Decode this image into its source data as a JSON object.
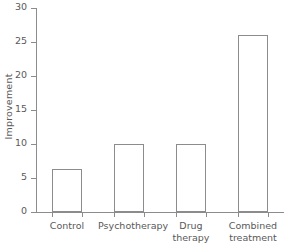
{
  "chart_data": {
    "type": "bar",
    "title": "",
    "subtitle": "",
    "xlabel": "",
    "ylabel": "Improvement",
    "categories": [
      "Control",
      "Psychotherapy",
      "Drug\ntherapy",
      "Combined\ntreatment"
    ],
    "values": [
      6.3,
      10,
      10,
      26
    ],
    "ylim": [
      0,
      30
    ],
    "yticks": [
      0,
      5,
      10,
      15,
      20,
      25,
      30
    ],
    "ytick_labels": [
      "0",
      "5",
      "10",
      "15",
      "20",
      "25",
      "30"
    ],
    "grid": false,
    "legend": null,
    "bar_fill": "#ffffff",
    "bar_edge": "#8c8c8c",
    "axis_color": "#8c8c8c",
    "text_color": "#595959",
    "background": "#ffffff"
  }
}
